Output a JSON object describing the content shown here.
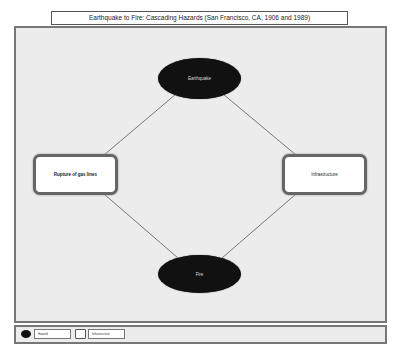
{
  "title": "Earthquake to Fire: Cascading Hazards (San Francisco, CA, 1906 and 1989)",
  "nodes": {
    "earthquake": {
      "label": "Earthquake",
      "type": "hazard"
    },
    "rupture": {
      "label": "Rupture of gas lines",
      "type": "infrastructure"
    },
    "infrastructure": {
      "label": "Infrastructure",
      "type": "infrastructure"
    },
    "fire": {
      "label": "Fire",
      "type": "hazard"
    }
  },
  "edges": [
    {
      "from": "Earthquake",
      "to": "Rupture of gas lines"
    },
    {
      "from": "Earthquake",
      "to": "Infrastructure"
    },
    {
      "from": "Rupture of gas lines",
      "to": "Fire"
    },
    {
      "from": "Infrastructure",
      "to": "Fire"
    }
  ],
  "legend": {
    "hazard": "Hazard",
    "infrastructure": "Infrastructure"
  },
  "colors": {
    "hazard_fill": "#111111",
    "infrastructure_fill": "#ffffff",
    "canvas_bg": "#ececec",
    "border": "#777777"
  }
}
